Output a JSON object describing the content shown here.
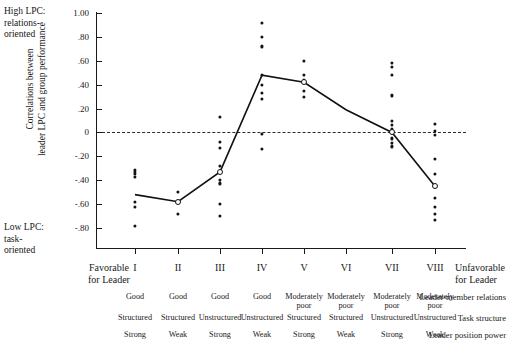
{
  "annotations": {
    "high_lpc": "High LPC:\nrelations-\noriented",
    "low_lpc": "Low LPC:\ntask-\noriented",
    "favorable": "Favorable\nfor Leader",
    "unfavorable": "Unfavorable\nfor Leader"
  },
  "axis_title": {
    "line1": "Correlations between",
    "line2": "leader LPC and group performance"
  },
  "chart_data": {
    "type": "scatter",
    "title": "",
    "xlabel": "",
    "ylabel": "Correlations between leader LPC and group performance",
    "ylim": [
      -0.9,
      1.0
    ],
    "grid": false,
    "legend": "none",
    "zero_reference_line": 0,
    "ytick_labels": [
      "1.00",
      ".80",
      ".60",
      ".40",
      ".20",
      "0",
      "-.20",
      "-.40",
      "-.60",
      "-.80"
    ],
    "ytick_values": [
      1.0,
      0.8,
      0.6,
      0.4,
      0.2,
      0.0,
      -0.2,
      -0.4,
      -0.6,
      -0.8
    ],
    "categories": [
      "I",
      "II",
      "III",
      "IV",
      "V",
      "VI",
      "VII",
      "VIII"
    ],
    "series": [
      {
        "name": "Median correlation",
        "values": [
          -0.52,
          -0.58,
          -0.33,
          0.48,
          0.42,
          0.19,
          0.0,
          -0.45
        ]
      }
    ],
    "points": [
      {
        "octant": "I",
        "values": [
          -0.31,
          -0.33,
          -0.35,
          -0.37,
          -0.58,
          -0.62,
          -0.78
        ]
      },
      {
        "octant": "II",
        "values": [
          -0.5,
          -0.57,
          -0.58,
          -0.68
        ]
      },
      {
        "octant": "III",
        "values": [
          0.13,
          -0.08,
          -0.13,
          -0.28,
          -0.33,
          -0.4,
          -0.42,
          -0.43,
          -0.6,
          -0.7
        ]
      },
      {
        "octant": "IV",
        "values": [
          0.92,
          0.8,
          0.72,
          0.48,
          0.4,
          0.33,
          0.28,
          -0.01,
          -0.14
        ]
      },
      {
        "octant": "V",
        "values": [
          0.6,
          0.48,
          0.44,
          0.42,
          0.35,
          0.3
        ]
      },
      {
        "octant": "VI",
        "values": []
      },
      {
        "octant": "VII",
        "values": [
          0.58,
          0.55,
          0.48,
          0.31,
          0.1,
          0.06,
          0.03,
          0.0,
          -0.05,
          -0.09,
          -0.11,
          -0.12
        ]
      },
      {
        "octant": "VIII",
        "values": [
          0.07,
          0.01,
          -0.02,
          -0.22,
          -0.35,
          -0.45,
          -0.55,
          -0.62,
          -0.68,
          -0.73
        ]
      }
    ]
  },
  "table": {
    "rows": [
      {
        "label": "Leader-member relations",
        "cells": [
          "Good",
          "Good",
          "Good",
          "Good",
          "Moderately\npoor",
          "Moderately\npoor",
          "Moderately\npoor",
          "Moderately\npoor"
        ]
      },
      {
        "label": "Task structure",
        "cells": [
          "Structured",
          "Structured",
          "Unstructured",
          "Unstructured",
          "Structured",
          "Structured",
          "Unstructured",
          "Unstructured"
        ]
      },
      {
        "label": "Leader position power",
        "cells": [
          "Strong",
          "Weak",
          "Strong",
          "Weak",
          "Strong",
          "Weak",
          "Strong",
          "Weak"
        ]
      }
    ]
  },
  "colors": {
    "ink": "#121212",
    "line": "#111111",
    "background": "#ffffff"
  }
}
